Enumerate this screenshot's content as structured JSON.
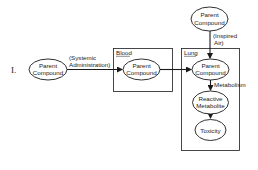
{
  "figure": {
    "panel_label": "I."
  },
  "containers": {
    "blood": {
      "label": "Blood"
    },
    "lung": {
      "label": "Lung"
    }
  },
  "nodes": {
    "source": {
      "line1": "Parent",
      "line2": "Compound"
    },
    "blood_parent": {
      "line1": "Parent",
      "line2": "Compound"
    },
    "inhaled_parent": {
      "line1": "Parent",
      "line2": "Compound"
    },
    "lung_parent": {
      "line1": "Parent",
      "line2": "Compound"
    },
    "reactive_metabolite": {
      "line1": "Reactive",
      "line2": "Metabolite"
    },
    "toxicity": {
      "line1": "Toxicity"
    }
  },
  "edges": {
    "systemic": {
      "line1": "(Systemic",
      "line2": "Administration)"
    },
    "inspired": {
      "line1": "(Inspired",
      "line2": "Air)"
    },
    "metabolism": {
      "label": "Metabolism"
    }
  },
  "colors": {
    "ink": "#1a1a1a",
    "background": "#ffffff"
  }
}
